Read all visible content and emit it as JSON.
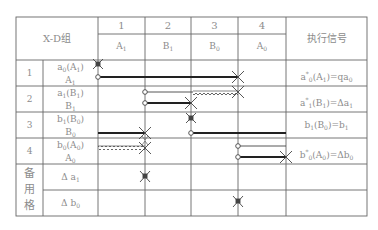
{
  "table": {
    "corner_label": "X-D组",
    "exec_header": "执行信号",
    "columns": [
      {
        "num": "1",
        "action": "A",
        "action_sub": "1"
      },
      {
        "num": "2",
        "action": "B",
        "action_sub": "1"
      },
      {
        "num": "3",
        "action": "B",
        "action_sub": "0"
      },
      {
        "num": "4",
        "action": "A",
        "action_sub": "0"
      }
    ],
    "rows": [
      {
        "num": "1",
        "signal": "a",
        "signal_sub": "0",
        "signal_arg": "(A",
        "signal_arg_sub": "1",
        "signal_close": ")",
        "action": "A",
        "action_sub": "1",
        "exec_pre": "a",
        "exec_sup": "*",
        "exec_sub": "0",
        "exec_post": "(A",
        "exec_post_sub": "1",
        "exec_tail": ")=qa",
        "exec_tail_sub": "0"
      },
      {
        "num": "2",
        "signal": "a",
        "signal_sub": "1",
        "signal_arg": "(B",
        "signal_arg_sub": "1",
        "signal_close": ")",
        "action": "B",
        "action_sub": "1",
        "exec_pre": "a",
        "exec_sup": "*",
        "exec_sub": "1",
        "exec_post": "(B",
        "exec_post_sub": "1",
        "exec_tail": ")=Δa",
        "exec_tail_sub": "1"
      },
      {
        "num": "3",
        "signal": "b",
        "signal_sub": "1",
        "signal_arg": "(B",
        "signal_arg_sub": "0",
        "signal_close": ")",
        "action": "B",
        "action_sub": "0",
        "exec_pre": "b",
        "exec_sup": "",
        "exec_sub": "1",
        "exec_post": "(B",
        "exec_post_sub": "0",
        "exec_tail": ")=b",
        "exec_tail_sub": "1"
      },
      {
        "num": "4",
        "signal": "b",
        "signal_sub": "0",
        "signal_arg": "(A",
        "signal_arg_sub": "0",
        "signal_close": ")",
        "action": "A",
        "action_sub": "0",
        "exec_pre": "b",
        "exec_sup": "*",
        "exec_sub": "0",
        "exec_post": "(A",
        "exec_post_sub": "0",
        "exec_tail": ")=Δb",
        "exec_tail_sub": "0"
      }
    ],
    "spare": {
      "label_chars": [
        "备",
        "用",
        "格"
      ],
      "items": [
        {
          "label": "Δ a",
          "label_sub": "1"
        },
        {
          "label": "Δ b",
          "label_sub": "0"
        }
      ]
    }
  },
  "colors": {
    "grid": "#555555",
    "line": "#333333",
    "text": "#8c8c8c"
  }
}
